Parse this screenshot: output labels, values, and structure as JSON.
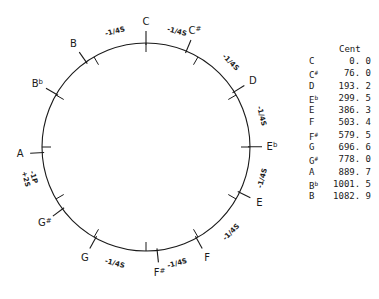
{
  "diagram": {
    "center": [
      146,
      147
    ],
    "radius": 104,
    "notes": [
      {
        "name": "C",
        "sym": "",
        "cents": 0.0,
        "display": "0.0"
      },
      {
        "name": "C",
        "sym": "#",
        "cents": 76.0,
        "display": "76.0"
      },
      {
        "name": "D",
        "sym": "",
        "cents": 193.2,
        "display": "193.2"
      },
      {
        "name": "E",
        "sym": "b",
        "cents": 299.5,
        "display": "299.5"
      },
      {
        "name": "E",
        "sym": "",
        "cents": 386.3,
        "display": "386.3"
      },
      {
        "name": "F",
        "sym": "",
        "cents": 503.4,
        "display": "503.4"
      },
      {
        "name": "F",
        "sym": "#",
        "cents": 579.5,
        "display": "579.5"
      },
      {
        "name": "G",
        "sym": "",
        "cents": 696.6,
        "display": "696.6"
      },
      {
        "name": "G",
        "sym": "#",
        "cents": 778.0,
        "display": "778.0"
      },
      {
        "name": "A",
        "sym": "",
        "cents": 889.7,
        "display": "889.7"
      },
      {
        "name": "B",
        "sym": "b",
        "cents": 1001.5,
        "display": "1001.5"
      },
      {
        "name": "B",
        "sym": "",
        "cents": 1082.9,
        "display": "1082.9"
      }
    ],
    "fifth_labels": [
      {
        "between": [
          "F",
          "C"
        ],
        "angle": -15,
        "text": "-1/4S"
      },
      {
        "between": [
          "C",
          "G"
        ],
        "angle": 15,
        "text": "-1/4S"
      },
      {
        "between": [
          "G",
          "D"
        ],
        "angle": 45,
        "text": "-1/4S"
      },
      {
        "between": [
          "D",
          "A"
        ],
        "angle": 75,
        "text": "-1/4S"
      },
      {
        "between": [
          "A",
          "E"
        ],
        "angle": 105,
        "text": "-1/4S"
      },
      {
        "between": [
          "E",
          "B"
        ],
        "angle": 135,
        "text": "-1/4S"
      },
      {
        "between": [
          "B",
          "F#"
        ],
        "angle": 165,
        "text": "-1/4S"
      },
      {
        "between": [
          "F#",
          "C#"
        ],
        "angle": 195,
        "text": "-1/4S"
      },
      {
        "between": [
          "C#",
          "G#"
        ],
        "angle": 225,
        "text": ""
      },
      {
        "between": [
          "G#",
          "Eb"
        ],
        "angle": 255,
        "text": "-1P\n+2S"
      }
    ]
  },
  "table": {
    "header": "Cent"
  }
}
